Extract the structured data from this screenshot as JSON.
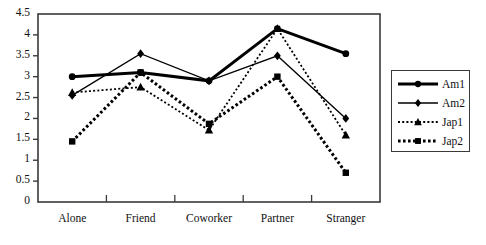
{
  "chart_data": {
    "type": "line",
    "title": "",
    "xlabel": "",
    "ylabel": "",
    "categories": [
      "Alone",
      "Friend",
      "Coworker",
      "Partner",
      "Stranger"
    ],
    "ylim": [
      0,
      4.5
    ],
    "yticks": [
      "0",
      "0.5",
      "1",
      "1.5",
      "2",
      "2.5",
      "3",
      "3.5",
      "4",
      "4.5"
    ],
    "ytick_values": [
      0,
      0.5,
      1,
      1.5,
      2,
      2.5,
      3,
      3.5,
      4,
      4.5
    ],
    "grid": false,
    "legend_position": "right-outside",
    "series": [
      {
        "name": "Am1",
        "values": [
          3.0,
          3.1,
          2.9,
          4.15,
          3.55
        ],
        "marker": "circle",
        "line_style": "solid",
        "line_width": 3.0,
        "color": "#000000"
      },
      {
        "name": "Am2",
        "values": [
          2.55,
          3.55,
          2.9,
          3.5,
          2.0
        ],
        "marker": "diamond",
        "line_style": "solid",
        "line_width": 1.4,
        "color": "#000000"
      },
      {
        "name": "Jap1",
        "values": [
          2.62,
          2.75,
          1.72,
          4.15,
          1.6
        ],
        "marker": "triangle",
        "line_style": "dotted",
        "line_width": 1.8,
        "color": "#000000"
      },
      {
        "name": "Jap2",
        "values": [
          1.45,
          3.1,
          1.87,
          3.0,
          0.7
        ],
        "marker": "square",
        "line_style": "dotted",
        "line_width": 3.0,
        "color": "#000000"
      }
    ]
  },
  "axes": {
    "frame_color": "#3a3a3a",
    "tick_color": "#3a3a3a"
  },
  "legend": {
    "entries": [
      "Am1",
      "Am2",
      "Jap1",
      "Jap2"
    ]
  }
}
